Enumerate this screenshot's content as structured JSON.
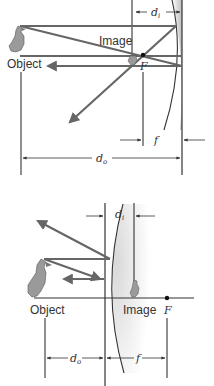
{
  "diagrams": [
    {
      "id": "concave-mirror",
      "labels": {
        "object": "Object",
        "image": "Image",
        "focal_point": "F",
        "focal_length": "f",
        "object_distance": "d",
        "object_distance_sub": "o",
        "image_distance": "d",
        "image_distance_sub": "i"
      }
    },
    {
      "id": "convex-mirror",
      "labels": {
        "object": "Object",
        "image": "Image",
        "focal_point": "F",
        "focal_length": "f",
        "object_distance": "d",
        "object_distance_sub": "o",
        "image_distance": "d",
        "image_distance_sub": "i"
      }
    }
  ],
  "colors": {
    "ray": "#666666",
    "line": "#333333",
    "mirror_shade": "#cfcfcf"
  }
}
